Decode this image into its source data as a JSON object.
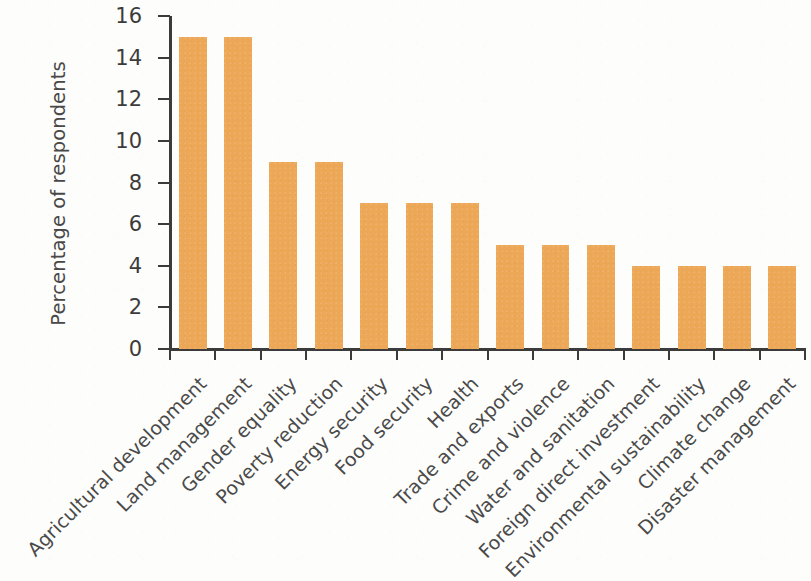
{
  "chart_data": {
    "type": "bar",
    "title": "",
    "subtitle": "",
    "xlabel": "",
    "ylabel": "Percentage of respondents",
    "ylim": [
      0,
      16
    ],
    "ytick_labels": [
      "0",
      "2",
      "4",
      "6",
      "8",
      "10",
      "12",
      "14",
      "16"
    ],
    "ytick_values": [
      0,
      2,
      4,
      6,
      8,
      10,
      12,
      14,
      16
    ],
    "grid": false,
    "legend": false,
    "legend_position": "none",
    "bar_color": "#eca757",
    "axis_color": "#3b3b3b",
    "text_color": "#4a4a4a",
    "background_color": "#fdfdfb",
    "xtick_label_rotation": -45,
    "categories": [
      "Agricultural development",
      "Land management",
      "Gender equality",
      "Poverty reduction",
      "Energy security",
      "Food security",
      "Health",
      "Trade and exports",
      "Crime and violence",
      "Water and sanitation",
      "Foreign direct investment",
      "Environmental sustainability",
      "Climate change",
      "Disaster management"
    ],
    "values": [
      15,
      15,
      9,
      9,
      7,
      7,
      7,
      5,
      5,
      5,
      4,
      4,
      4,
      4
    ]
  }
}
